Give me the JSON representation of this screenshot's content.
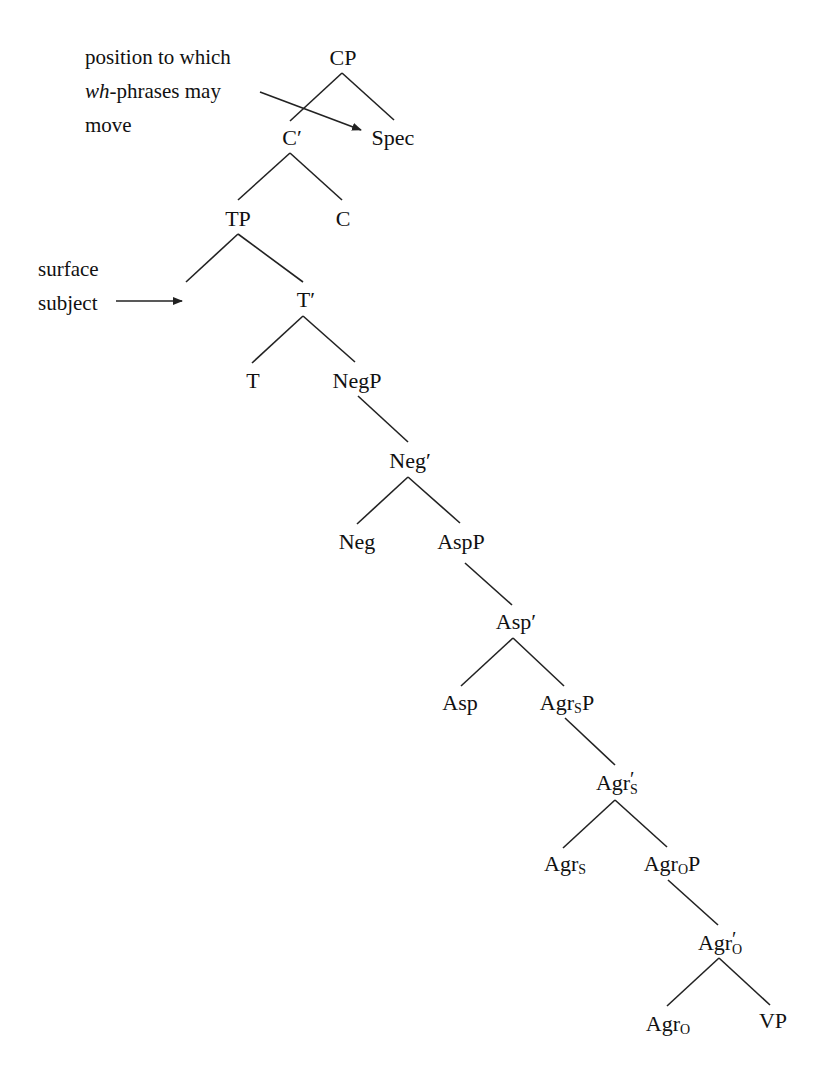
{
  "diagram": {
    "type": "syntax-tree",
    "nodes": {
      "cp": "CP",
      "c_bar": "C′",
      "spec": "Spec",
      "tp": "TP",
      "c": "C",
      "t_bar": "T′",
      "t": "T",
      "negp": "NegP",
      "neg_bar": "Neg′",
      "neg": "Neg",
      "aspp": "AspP",
      "asp_bar": "Asp′",
      "asp": "Asp",
      "agrsp_base": "Agr",
      "agrsp_sub": "S",
      "agrsp_tail": "P",
      "agrs_bar_base": "Agr",
      "agrs_bar_sub": "S",
      "agrs_bar_prime": "′",
      "agrs_base": "Agr",
      "agrs_sub": "S",
      "agrop_base": "Agr",
      "agrop_sub": "O",
      "agrop_tail": "P",
      "agro_bar_base": "Agr",
      "agro_bar_sub": "O",
      "agro_bar_prime": "′",
      "agro_base": "Agr",
      "agro_sub": "O",
      "vp": "VP"
    },
    "annotations": {
      "wh": {
        "line1": "position to which",
        "line2_italic": "wh",
        "line2_rest": "-phrases may",
        "line3": "move"
      },
      "subject": {
        "line1": "surface",
        "line2": "subject"
      }
    },
    "colors": {
      "line": "#222222",
      "text": "#111111",
      "background": "#ffffff"
    }
  }
}
